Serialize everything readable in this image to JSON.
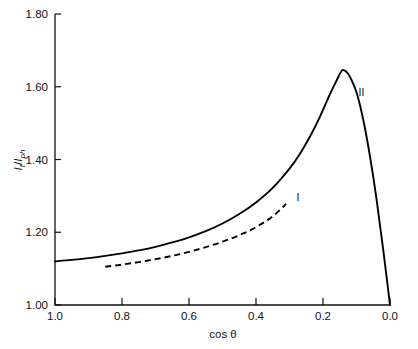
{
  "chart_data": {
    "type": "line",
    "title": "",
    "subtitle": "",
    "xlabel": "cos θ",
    "ylabel": "I_f/I_ph",
    "ylabel_parts": {
      "numerator": "I",
      "numerator_sub": "f",
      "denominator": "I",
      "denominator_sub": "ph",
      "separator": "/"
    },
    "xlim": [
      1.0,
      0.0
    ],
    "ylim": [
      1.0,
      1.8
    ],
    "x_reversed": true,
    "grid": false,
    "legend": "none",
    "xticks": [
      1.0,
      0.8,
      0.6,
      0.4,
      0.2,
      0.0
    ],
    "xticklabels": [
      "1.0",
      "0.8",
      "0.6",
      "0.4",
      "0.2",
      "0.0"
    ],
    "yticks": [
      1.0,
      1.2,
      1.4,
      1.6,
      1.8
    ],
    "yticklabels": [
      "1.00",
      "1.20",
      "1.40",
      "1.60",
      "1.80"
    ],
    "annotations": [
      {
        "text": "I",
        "x": 0.275,
        "y": 1.285
      },
      {
        "text": "II",
        "x": 0.085,
        "y": 1.575
      }
    ],
    "series": [
      {
        "name": "II",
        "style": "solid",
        "label": "II",
        "x": [
          1.0,
          0.95,
          0.9,
          0.85,
          0.8,
          0.75,
          0.7,
          0.65,
          0.6,
          0.55,
          0.5,
          0.45,
          0.4,
          0.35,
          0.3,
          0.27,
          0.24,
          0.21,
          0.18,
          0.16,
          0.143,
          0.13,
          0.12,
          0.1,
          0.08,
          0.06,
          0.04,
          0.02,
          0.0
        ],
        "y": [
          1.12,
          1.124,
          1.129,
          1.135,
          1.142,
          1.15,
          1.16,
          1.172,
          1.186,
          1.203,
          1.224,
          1.25,
          1.282,
          1.322,
          1.375,
          1.414,
          1.461,
          1.516,
          1.578,
          1.616,
          1.645,
          1.641,
          1.628,
          1.585,
          1.51,
          1.41,
          1.29,
          1.15,
          1.0
        ]
      },
      {
        "name": "I",
        "style": "dashed",
        "label": "I",
        "x": [
          0.85,
          0.8,
          0.75,
          0.7,
          0.65,
          0.6,
          0.55,
          0.5,
          0.45,
          0.4,
          0.35,
          0.31
        ],
        "y": [
          1.105,
          1.111,
          1.118,
          1.126,
          1.135,
          1.146,
          1.159,
          1.174,
          1.192,
          1.214,
          1.244,
          1.278
        ]
      }
    ],
    "colors": {
      "series_solid": "#000000",
      "series_dashed": "#000000",
      "axis": "#111111",
      "background": "#ffffff"
    }
  },
  "figure": {
    "plot_area": {
      "left": 55,
      "right": 390,
      "top": 14,
      "bottom": 305
    }
  }
}
